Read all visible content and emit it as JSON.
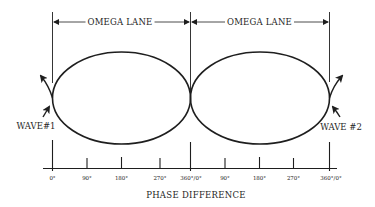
{
  "diagram": {
    "type": "phase-difference-lane-diagram",
    "colors": {
      "ink": "#1e1e1e",
      "background": "#ffffff"
    },
    "lanes": [
      {
        "label": "OMEGA LANE",
        "from_deg_label": "0°",
        "to_deg_label": "360°/0°"
      },
      {
        "label": "OMEGA LANE",
        "from_deg_label": "360°/0°",
        "to_deg_label": "360°/0°"
      }
    ],
    "waves": [
      {
        "label": "WAVE#1",
        "side": "left",
        "arrow": "arrow-up-left-icon"
      },
      {
        "label": "WAVE #2",
        "side": "right",
        "arrow": "arrow-up-right-icon"
      }
    ],
    "axis": {
      "title": "PHASE DIFFERENCE",
      "ticks": [
        "0°",
        "90°",
        "180°",
        "270°",
        "360°/0°",
        "90°",
        "180°",
        "270°",
        "360°/0°"
      ]
    }
  }
}
